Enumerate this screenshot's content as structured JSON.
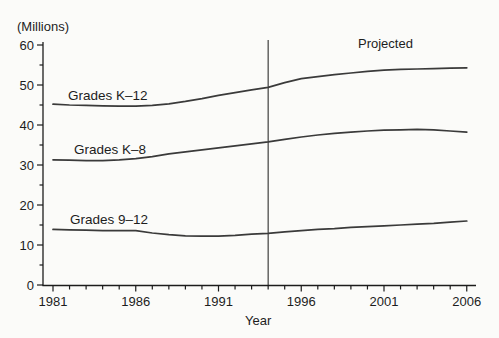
{
  "figure": {
    "unit_label": "(Millions)",
    "projected_label": "Projected",
    "x_axis_title": "Year"
  },
  "chart_data": {
    "type": "line",
    "title": "",
    "ylabel": "(Millions)",
    "xlabel": "Year",
    "ylim": [
      0,
      60
    ],
    "xlim": [
      1981,
      2006
    ],
    "grid": false,
    "legend": "inline-labels",
    "y_major_ticks": [
      60,
      50,
      40,
      30,
      20,
      10,
      0
    ],
    "y_minor_step": 5,
    "x_labeled_ticks": [
      1981,
      1986,
      1991,
      1996,
      2001,
      2006
    ],
    "x_minor_step": 1,
    "projection_divider_year": 1994,
    "projected_region_label": "Projected",
    "axis_color": "#1c1c1c",
    "line_color": "#3a3a3a",
    "divider_color": "#2e2e2e",
    "x": [
      1981,
      1982,
      1983,
      1984,
      1985,
      1986,
      1987,
      1988,
      1989,
      1990,
      1991,
      1992,
      1993,
      1994,
      1995,
      1996,
      1997,
      1998,
      1999,
      2000,
      2001,
      2002,
      2003,
      2004,
      2005,
      2006
    ],
    "series": [
      {
        "name": "Grades K–12",
        "values": [
          45.2,
          45.0,
          44.9,
          44.8,
          44.7,
          44.7,
          44.9,
          45.3,
          45.9,
          46.6,
          47.4,
          48.1,
          48.8,
          49.4,
          50.6,
          51.6,
          52.1,
          52.6,
          53.0,
          53.4,
          53.7,
          53.9,
          54.0,
          54.1,
          54.2,
          54.3
        ],
        "label_pos_px": [
          68,
          100
        ]
      },
      {
        "name": "Grades K–8",
        "values": [
          31.3,
          31.2,
          31.1,
          31.1,
          31.3,
          31.6,
          32.1,
          32.8,
          33.3,
          33.8,
          34.3,
          34.8,
          35.3,
          35.8,
          36.4,
          37.0,
          37.5,
          37.9,
          38.2,
          38.5,
          38.7,
          38.8,
          38.9,
          38.8,
          38.5,
          38.2
        ],
        "label_pos_px": [
          74,
          154
        ]
      },
      {
        "name": "Grades 9–12",
        "values": [
          13.9,
          13.8,
          13.7,
          13.6,
          13.6,
          13.6,
          13.0,
          12.6,
          12.3,
          12.2,
          12.2,
          12.4,
          12.7,
          12.9,
          13.3,
          13.6,
          13.9,
          14.1,
          14.4,
          14.6,
          14.8,
          15.0,
          15.2,
          15.4,
          15.7,
          16.0
        ],
        "label_pos_px": [
          70,
          224
        ]
      }
    ]
  }
}
